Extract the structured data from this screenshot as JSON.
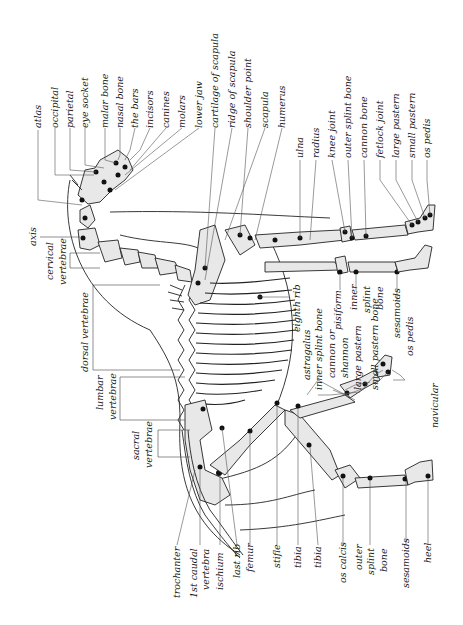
{
  "diagram": {
    "orientation": "rotated 90 degrees (head at top, back on left, legs pointing right)",
    "labels_top": [
      {
        "id": "atlas",
        "text": "atlas"
      },
      {
        "id": "occipital",
        "text": "occipital"
      },
      {
        "id": "parietal",
        "text": "parietal"
      },
      {
        "id": "eye-socket",
        "text": "eye socket"
      },
      {
        "id": "malar-bone",
        "text": "malar bone"
      },
      {
        "id": "nasal-bone",
        "text": "nasal bone"
      },
      {
        "id": "the-bars",
        "text": "the bars"
      },
      {
        "id": "incisors",
        "text": "incisors"
      },
      {
        "id": "canines",
        "text": "canines"
      },
      {
        "id": "molars",
        "text": "molars"
      },
      {
        "id": "lower-jaw",
        "text": "lower jaw"
      },
      {
        "id": "cartilage-of-scapula",
        "text": "cartilage of scapula"
      },
      {
        "id": "ridge-of-scapula",
        "text": "ridge of scapula"
      },
      {
        "id": "shoulder-point",
        "text": "shoulder point"
      },
      {
        "id": "scapula",
        "text": "scapula"
      },
      {
        "id": "humerus",
        "text": "humerus"
      }
    ],
    "labels_foreleg": [
      {
        "id": "ulna",
        "text": "ulna"
      },
      {
        "id": "radius",
        "text": "radius"
      },
      {
        "id": "knee-joint",
        "text": "knee joint"
      },
      {
        "id": "outer-splint-bone-fore",
        "text": "outer splint bone"
      },
      {
        "id": "cannon-bone",
        "text": "cannon bone"
      },
      {
        "id": "fetlock-joint",
        "text": "fetlock joint"
      },
      {
        "id": "large-pastern-fore",
        "text": "large pastern"
      },
      {
        "id": "small-pastern-fore",
        "text": "small pastern"
      },
      {
        "id": "os-pedis-fore",
        "text": "os pedis"
      }
    ],
    "labels_spine": [
      {
        "id": "axis",
        "text": "axis"
      },
      {
        "id": "cervical-vertebrae",
        "text": [
          "cervical",
          "vertebrae"
        ]
      },
      {
        "id": "dorsal-vertebrae",
        "text": "dorsal vertebrae"
      },
      {
        "id": "lumbar-vertebrae",
        "text": [
          "lumbar",
          "vertebrae"
        ]
      },
      {
        "id": "sacral-vertebrae",
        "text": [
          "sacral",
          "vertebrae"
        ]
      }
    ],
    "labels_middle": [
      {
        "id": "eighth-rib",
        "text": "eighth rib"
      },
      {
        "id": "pisiform",
        "text": "pisiform"
      },
      {
        "id": "inner-splint-bone-fore",
        "text": [
          "inner",
          "splint",
          "bone"
        ]
      },
      {
        "id": "sesamoids-fore",
        "text": "sesamoids"
      },
      {
        "id": "os-pedis-mid",
        "text": "os pedis"
      },
      {
        "id": "astragalus",
        "text": "astragalus"
      },
      {
        "id": "inner-splint-bone-hind",
        "text": "inner splint bone"
      },
      {
        "id": "cannon-or",
        "text": "cannon or"
      },
      {
        "id": "shannon",
        "text": "shannon"
      },
      {
        "id": "large-pastern-hind",
        "text": "large pastern"
      },
      {
        "id": "small-pastern-hind",
        "text": "small pastern bone"
      },
      {
        "id": "navicular",
        "text": "navicular"
      }
    ],
    "labels_bottom": [
      {
        "id": "trochanter",
        "text": "trochanter"
      },
      {
        "id": "first-caudal-vertebra",
        "text": [
          "1st caudal",
          "vertebra"
        ]
      },
      {
        "id": "ischium",
        "text": "ischium"
      },
      {
        "id": "last-rib",
        "text": "last rib"
      },
      {
        "id": "femur",
        "text": "femur"
      },
      {
        "id": "stifle",
        "text": "stifle"
      },
      {
        "id": "tibia-1",
        "text": "tibia"
      },
      {
        "id": "tibia-2",
        "text": "tibia"
      },
      {
        "id": "os-calcis",
        "text": "os calcis"
      },
      {
        "id": "outer-splint-bone-hind",
        "text": [
          "outer",
          "splint",
          "bone"
        ]
      },
      {
        "id": "sesamoids-hind",
        "text": "sesamoids"
      },
      {
        "id": "heel",
        "text": "heel"
      }
    ],
    "colors": {
      "background": "#ffffff",
      "bone_fill": "#e8e8e8",
      "ink": "#1a1a1a"
    }
  }
}
